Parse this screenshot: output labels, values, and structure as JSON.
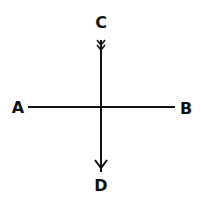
{
  "diagram": {
    "type": "crossed-lines",
    "labels": {
      "top": "C",
      "bottom": "D",
      "left": "A",
      "right": "B"
    },
    "lines": [
      {
        "name": "AB",
        "from": "A",
        "to": "B",
        "arrow": "none"
      },
      {
        "name": "CD",
        "from": "C",
        "to": "D",
        "arrow": "D",
        "tail_feather": "C"
      }
    ],
    "colors": {
      "stroke": "#111111",
      "background": "#ffffff"
    }
  }
}
